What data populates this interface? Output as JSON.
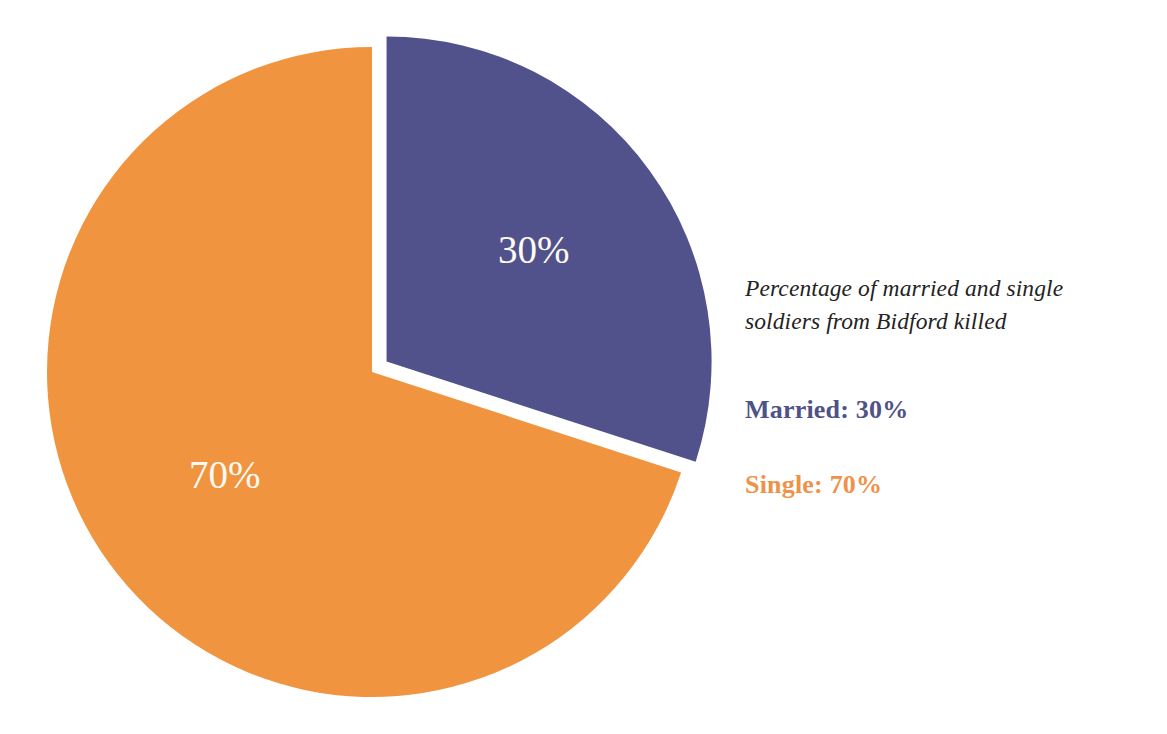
{
  "chart_data": {
    "type": "pie",
    "title": "",
    "caption": "Percentage of married and single soldiers from Bidford killed",
    "caption_lines": [
      "Percentage of married and single",
      "soldiers from Bidford killed"
    ],
    "categories": [
      "Married",
      "Single"
    ],
    "values": [
      30,
      70
    ],
    "value_labels": [
      "30%",
      "70%"
    ],
    "unit": "%",
    "total": 100,
    "colors": [
      "#51528c",
      "#f1943f"
    ],
    "exploded_slices": [
      "Married"
    ],
    "start_angle_deg": 0,
    "direction": "clockwise",
    "legend_position": "right",
    "grid": false,
    "slices": [
      {
        "name": "Married",
        "value": 30,
        "label": "30%",
        "color": "#51528c",
        "legend_text": "Married: 30%",
        "legend_color": "#4f5287",
        "exploded": true,
        "start_angle_deg": 0,
        "end_angle_deg": 108
      },
      {
        "name": "Single",
        "value": 70,
        "label": "70%",
        "color": "#f1943f",
        "legend_text": "Single: 70%",
        "legend_color": "#ef9249",
        "exploded": false,
        "start_angle_deg": 108,
        "end_angle_deg": 360
      }
    ]
  },
  "chart": {
    "slice_married_label": "30%",
    "slice_single_label": "70%",
    "slice_married_color": "#51528c",
    "slice_single_color": "#f1943f",
    "label_text_color": "#fdfaf4",
    "background_color": "#ffffff"
  },
  "legend": {
    "caption_line_1": "Percentage of married and single",
    "caption_line_2": "soldiers from Bidford killed",
    "caption_color": "#232323",
    "items": [
      {
        "label": "Married: 30%",
        "color": "#4f5287"
      },
      {
        "label": "Single: 70%",
        "color": "#ef9249"
      }
    ],
    "married_label": "Married: 30%",
    "single_label": "Single: 70%"
  }
}
